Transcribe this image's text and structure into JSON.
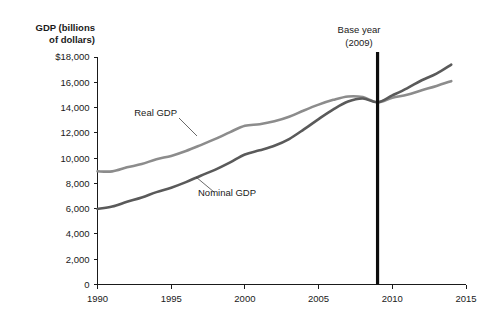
{
  "chart_data": {
    "type": "line",
    "title": "",
    "xlabel": "",
    "ylabel": "GDP (billions of dollars)",
    "xlim": [
      1990,
      2015
    ],
    "ylim": [
      0,
      18000
    ],
    "grid": false,
    "legend_position": "inline-annotation",
    "x_ticks": [
      "1990",
      "1995",
      "2000",
      "2005",
      "2010",
      "2015"
    ],
    "x_tick_values": [
      1990,
      1995,
      2000,
      2005,
      2010,
      2015
    ],
    "y_ticks": [
      "0",
      "2,000",
      "4,000",
      "6,000",
      "8,000",
      "10,000",
      "12,000",
      "14,000",
      "16,000",
      "$18,000"
    ],
    "y_tick_values": [
      0,
      2000,
      4000,
      6000,
      8000,
      10000,
      12000,
      14000,
      16000,
      18000
    ],
    "x": [
      1990,
      1991,
      1992,
      1993,
      1994,
      1995,
      1996,
      1997,
      1998,
      1999,
      2000,
      2001,
      2002,
      2003,
      2004,
      2005,
      2006,
      2007,
      2008,
      2009,
      2010,
      2011,
      2012,
      2013,
      2014
    ],
    "series": [
      {
        "name": "Real GDP",
        "color": "#8c8c8c",
        "values": [
          8955,
          8950,
          9270,
          9530,
          9910,
          10175,
          10560,
          11030,
          11520,
          12060,
          12560,
          12680,
          12910,
          13270,
          13770,
          14230,
          14610,
          14880,
          14830,
          14420,
          14780,
          15020,
          15370,
          15710,
          16090
        ]
      },
      {
        "name": "Nominal GDP",
        "color": "#5a5a5a",
        "values": [
          5980,
          6170,
          6540,
          6880,
          7310,
          7660,
          8100,
          8610,
          9090,
          9660,
          10290,
          10620,
          10980,
          11510,
          12270,
          13090,
          13860,
          14480,
          14720,
          14420,
          14960,
          15520,
          16160,
          16690,
          17400
        ]
      }
    ],
    "annotations": [
      {
        "name": "base-year",
        "label_line1": "Base year",
        "label_line2": "(2009)",
        "x_value": 2009
      },
      {
        "name": "real-gdp-callout",
        "label": "Real GDP"
      },
      {
        "name": "nominal-gdp-callout",
        "label": "Nominal GDP"
      }
    ]
  },
  "axis": {
    "title_line1": "GDP (billions",
    "title_line2": "of dollars)"
  }
}
